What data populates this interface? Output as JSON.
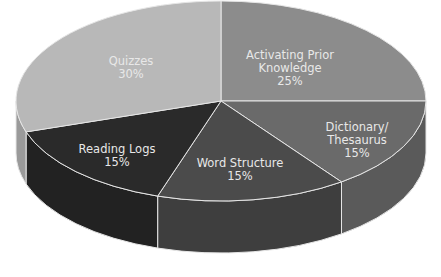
{
  "chart_data": {
    "type": "pie",
    "style": "3d",
    "title": "",
    "categories": [
      "Activating Prior Knowledge",
      "Dictionary/Thesaurus",
      "Word Structure",
      "Reading Logs",
      "Quizzes"
    ],
    "values": [
      25,
      15,
      15,
      15,
      30
    ],
    "unit": "%",
    "colors": [
      "#8c8c8c",
      "#6a6a6a",
      "#4b4b4b",
      "#2a2a2a",
      "#b8b8b8"
    ],
    "side_colors": [
      "#777777",
      "#5a5a5a",
      "#3e3e3e",
      "#222222",
      "#9a9a9a"
    ],
    "legend": "none",
    "labels": [
      {
        "line1": "Activating Prior",
        "line2": "Knowledge",
        "pct": "25%"
      },
      {
        "line1": "Dictionary/",
        "line2": "Thesaurus",
        "pct": "15%"
      },
      {
        "line1": "Word Structure",
        "line2": "",
        "pct": "15%"
      },
      {
        "line1": "Reading Logs",
        "line2": "",
        "pct": "15%"
      },
      {
        "line1": "Quizzes",
        "line2": "",
        "pct": "30%"
      }
    ]
  }
}
